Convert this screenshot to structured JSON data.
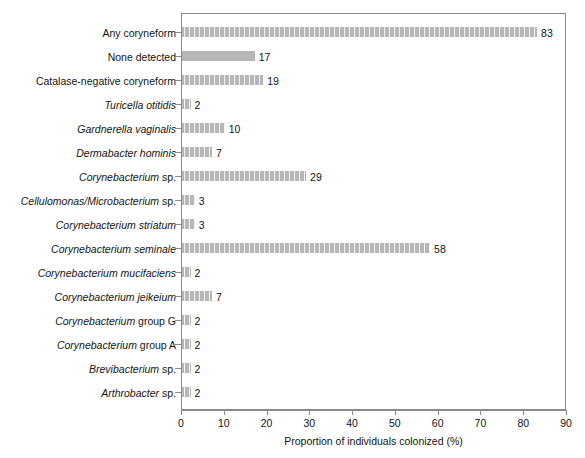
{
  "chart_data": {
    "type": "bar",
    "orientation": "horizontal",
    "title": "",
    "xlabel": "Proportion of individuals colonized (%)",
    "ylabel": "",
    "xlim": [
      0,
      90
    ],
    "xticks": [
      0,
      10,
      20,
      30,
      40,
      50,
      60,
      70,
      80,
      90
    ],
    "grid": false,
    "legend": "none",
    "bar_color": "#b6b6b6",
    "bar_pattern": "vertical-hatch",
    "frame": true,
    "categories": [
      "Any coryneform",
      "None detected",
      "Catalase-negative coryneform",
      "Turicella otitidis",
      "Gardnerella vaginalis",
      "Dermabacter hominis",
      "Corynebacterium sp.",
      "Cellulomonas/Microbacterium sp.",
      "Corynebacterium striatum",
      "Corynebacterium seminale",
      "Corynebacterium mucifaciens",
      "Corynebacterium jeikeium",
      "Corynebacterium group G",
      "Corynebacterium group A",
      "Brevibacterium sp.",
      "Arthrobacter sp."
    ],
    "values": [
      83,
      17,
      19,
      2,
      10,
      7,
      29,
      3,
      3,
      58,
      2,
      7,
      2,
      2,
      2,
      2
    ],
    "value_labels": [
      "83",
      "17",
      "19",
      "2",
      "10",
      "7",
      "29",
      "3",
      "3",
      "58",
      "2",
      "7",
      "2",
      "2",
      "2",
      "2"
    ]
  },
  "rows": [
    {
      "label_italic": "",
      "label_upright": "Any coryneform",
      "value": 83,
      "value_label": "83",
      "hatched": true
    },
    {
      "label_italic": "",
      "label_upright": "None detected",
      "value": 17,
      "value_label": "17",
      "hatched": false
    },
    {
      "label_italic": "",
      "label_upright": "Catalase-negative coryneform",
      "value": 19,
      "value_label": "19",
      "hatched": true
    },
    {
      "label_italic": "Turicella otitidis",
      "label_upright": "",
      "value": 2,
      "value_label": "2",
      "hatched": true
    },
    {
      "label_italic": "Gardnerella vaginalis",
      "label_upright": "",
      "value": 10,
      "value_label": "10",
      "hatched": true
    },
    {
      "label_italic": "Dermabacter hominis",
      "label_upright": "",
      "value": 7,
      "value_label": "7",
      "hatched": true
    },
    {
      "label_italic": "Corynebacterium",
      "label_upright": " sp.",
      "value": 29,
      "value_label": "29",
      "hatched": true
    },
    {
      "label_italic": "Cellulomonas/Microbacterium",
      "label_upright": " sp.",
      "value": 3,
      "value_label": "3",
      "hatched": true
    },
    {
      "label_italic": "Corynebacterium striatum",
      "label_upright": "",
      "value": 3,
      "value_label": "3",
      "hatched": true
    },
    {
      "label_italic": "Corynebacterium seminale",
      "label_upright": "",
      "value": 58,
      "value_label": "58",
      "hatched": true
    },
    {
      "label_italic": "Corynebacterium mucifaciens",
      "label_upright": "",
      "value": 2,
      "value_label": "2",
      "hatched": true
    },
    {
      "label_italic": "Corynebacterium jeikeium",
      "label_upright": "",
      "value": 7,
      "value_label": "7",
      "hatched": true
    },
    {
      "label_italic": "Corynebacterium",
      "label_upright": " group G",
      "value": 2,
      "value_label": "2",
      "hatched": true
    },
    {
      "label_italic": "Corynebacterium",
      "label_upright": " group A",
      "value": 2,
      "value_label": "2",
      "hatched": true
    },
    {
      "label_italic": "Brevibacterium",
      "label_upright": " sp.",
      "value": 2,
      "value_label": "2",
      "hatched": true
    },
    {
      "label_italic": "Arthrobacter",
      "label_upright": " sp.",
      "value": 2,
      "value_label": "2",
      "hatched": true
    }
  ],
  "xaxis": {
    "title": "Proportion of individuals colonized (%)",
    "ticks": [
      "0",
      "10",
      "20",
      "30",
      "40",
      "50",
      "60",
      "70",
      "80",
      "90"
    ]
  }
}
